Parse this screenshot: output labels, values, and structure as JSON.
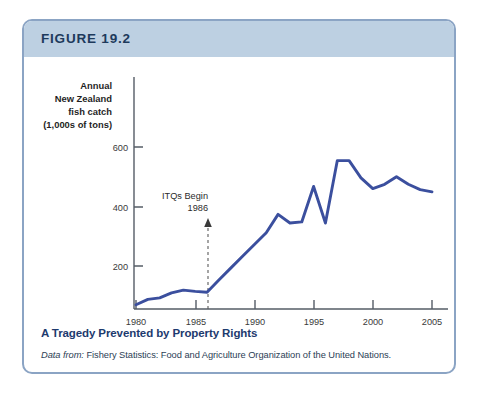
{
  "figure": {
    "number_label": "FIGURE 19.2",
    "caption_title": "A Tragedy Prevented by Property Rights",
    "source_lead": "Data from:",
    "source_rest": " Fishery Statistics: Food and Agriculture Organization of the United Nations.",
    "border_color": "#8ba4c4",
    "header_color": "#bdd0e2",
    "caption_color": "#1d3a6e",
    "line_color": "#3b4f9e"
  },
  "axis_title_lines": [
    "Annual",
    "New Zealand",
    "fish catch",
    "(1,000s of tons)"
  ],
  "annotation": {
    "line1": "ITQs Begin",
    "line2": "1986",
    "at_year": 1986
  },
  "xaxis_label": "Year",
  "chart_data": {
    "type": "line",
    "title": "A Tragedy Prevented by Property Rights",
    "xlabel": "Year",
    "ylabel": "Annual New Zealand fish catch (1,000s of tons)",
    "xlim": [
      1979.5,
      2005.5
    ],
    "ylim": [
      0,
      720
    ],
    "grid": false,
    "legend": null,
    "yticks": [
      200,
      400,
      600
    ],
    "xticks": [
      1980,
      1985,
      1990,
      1995,
      2000,
      2005
    ],
    "x": [
      1980,
      1981,
      1982,
      1983,
      1984,
      1985,
      1986,
      1987,
      1988,
      1989,
      1990,
      1991,
      1992,
      1993,
      1994,
      1995,
      1996,
      1997,
      1998,
      1999,
      2000,
      2001,
      2002,
      2003,
      2004,
      2005
    ],
    "values": [
      20,
      45,
      52,
      75,
      88,
      82,
      78,
      135,
      190,
      245,
      300,
      355,
      440,
      400,
      405,
      570,
      400,
      690,
      690,
      610,
      560,
      580,
      615,
      580,
      555,
      545
    ],
    "series": [
      {
        "name": "Annual New Zealand fish catch",
        "values": [
          20,
          45,
          52,
          75,
          88,
          82,
          78,
          135,
          190,
          245,
          300,
          355,
          440,
          400,
          405,
          570,
          400,
          690,
          690,
          610,
          560,
          580,
          615,
          580,
          555,
          545
        ]
      }
    ],
    "annotations": [
      {
        "text": "ITQs Begin 1986",
        "x": 1986,
        "type": "vertical-dashed-arrow"
      }
    ]
  }
}
